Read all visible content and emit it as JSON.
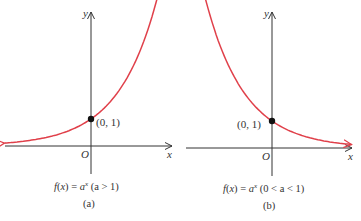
{
  "chart_data": [
    {
      "type": "line",
      "panel": "(a)",
      "function": "f(x) = a^x",
      "caption": "f(x) = a",
      "caption_exp": "x",
      "caption_cond": "(a > 1)",
      "sublabel": "(a)",
      "xlabel": "x",
      "ylabel": "y",
      "origin_label": "O",
      "point": {
        "x": 0,
        "y": 1,
        "label": "(0, 1)"
      },
      "base": 2,
      "xlim": [
        -3.5,
        3
      ],
      "ylim": [
        -1,
        5.8
      ],
      "curve_color": "#e0404a"
    },
    {
      "type": "line",
      "panel": "(b)",
      "function": "f(x) = a^x",
      "caption": "f(x) = a",
      "caption_exp": "x",
      "caption_cond": "(0 < a < 1)",
      "sublabel": "(b)",
      "xlabel": "x",
      "ylabel": "y",
      "origin_label": "O",
      "point": {
        "x": 0,
        "y": 1,
        "label": "(0, 1)"
      },
      "base": 0.5,
      "xlim": [
        -3,
        3.5
      ],
      "ylim": [
        -1,
        5.8
      ],
      "curve_color": "#e0404a"
    }
  ]
}
